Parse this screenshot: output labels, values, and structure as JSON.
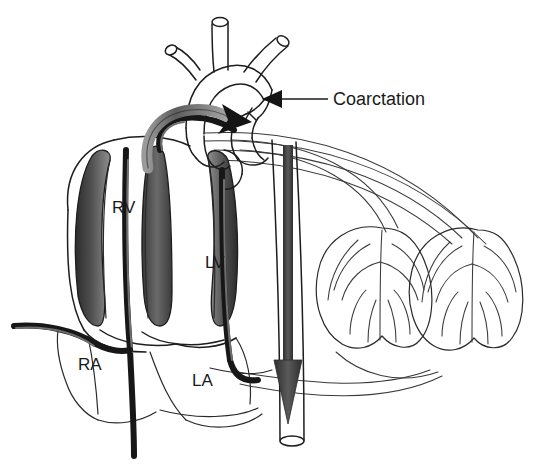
{
  "figure": {
    "background_color": "#ffffff",
    "line_color": "#1d1d1d",
    "shade_color": "#4a4a4a",
    "width": 551,
    "height": 466
  },
  "annotations": [
    {
      "id": "coarctation",
      "label": "Coarctation",
      "label_x": 333,
      "label_y": 105,
      "leader_from_x": 328,
      "leader_to_x": 268,
      "leader_y": 99,
      "arrow_direction": "left",
      "description": "Arrow indicating narrowed segment of descending aorta just distal to the left subclavian artery"
    }
  ],
  "chamber_labels": [
    {
      "id": "rv",
      "label": "RV",
      "name": "Right Ventricle",
      "x": 112,
      "y": 213
    },
    {
      "id": "lv",
      "label": "LV",
      "name": "Left Ventricle",
      "x": 205,
      "y": 268
    },
    {
      "id": "ra",
      "label": "RA",
      "name": "Right Atrium",
      "x": 78,
      "y": 370
    },
    {
      "id": "la",
      "label": "LA",
      "name": "Left Atrium",
      "x": 192,
      "y": 386
    }
  ],
  "structures": {
    "aortic_arch_branches": [
      "brachiocephalic-trunk",
      "left-common-carotid-artery",
      "left-subclavian-artery"
    ],
    "lungs": [
      {
        "id": "lung-left",
        "side": "left",
        "cx": 370,
        "cy": 283
      },
      {
        "id": "lung-right",
        "side": "right",
        "cx": 470,
        "cy": 283
      }
    ],
    "flow_arrows": [
      {
        "id": "arch-flow-arrow",
        "direction": "right",
        "location": "ascending-aorta-to-arch"
      },
      {
        "id": "descending-aorta-arrow",
        "direction": "down",
        "location": "descending-aorta"
      }
    ]
  }
}
